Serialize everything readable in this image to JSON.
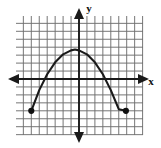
{
  "figure": {
    "kind": "coordinate-grid-graph",
    "title": "",
    "background_color": "#ffffff",
    "grid_color": "#6f6f6f",
    "axis_color": "#1a1a1a",
    "curve_color": "#1a1a1a",
    "point_color": "#111111"
  },
  "axes": {
    "x_label": "x",
    "y_label": "y",
    "origin_px": {
      "x": 79,
      "y": 79
    },
    "cell_px": 7.95,
    "x_arrow_left": "arrow-left",
    "x_arrow_right": "arrow-right",
    "y_arrow_up": "arrow-up",
    "y_arrow_down": "arrow-down"
  },
  "grid": {
    "left_px": 16,
    "top_px": 16,
    "right_px": 143,
    "bottom_px": 135,
    "columns": 16,
    "rows": 15,
    "show_grid": true
  },
  "chart_data": {
    "type": "line",
    "title": "",
    "xlabel": "x",
    "ylabel": "y",
    "grid": true,
    "legend": "none",
    "xlim": [
      -8,
      8
    ],
    "ylim": [
      -8,
      7
    ],
    "series": [
      {
        "name": "parabola",
        "shape": "downward-opening parabola",
        "equation": "y = -0.2(x + 6)(x - 5)",
        "vertex": [
          -0.5,
          3.7
        ],
        "x_intercepts": [
          -5.2,
          5.2
        ],
        "domain": [
          -6,
          5.9
        ],
        "endpoints_included": true,
        "x": [
          -6,
          -5,
          -4,
          -3,
          -2,
          -1,
          -0.5,
          0,
          1,
          2,
          3,
          4,
          5,
          5.9
        ],
        "y": [
          -4,
          -1.4,
          0.6,
          2.1,
          3.1,
          3.6,
          3.7,
          3.6,
          3.1,
          2.1,
          0.6,
          -1.4,
          -3.8,
          -4
        ]
      }
    ],
    "annotations": [
      {
        "kind": "endpoint-dot",
        "x": -6,
        "y": -4,
        "filled": true
      },
      {
        "kind": "endpoint-dot",
        "x": 5.9,
        "y": -4,
        "filled": true
      }
    ]
  }
}
